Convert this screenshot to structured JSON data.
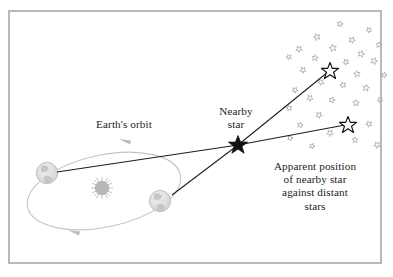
{
  "figure": {
    "kind": "stellar-parallax-diagram",
    "background_color": "#ffffff",
    "border_color": "#b9b9b9",
    "ink_color": "#242424",
    "faint_color": "#c9c9c9",
    "star_field_color": "#b0b0b4"
  },
  "labels": {
    "earth_orbit": "Earth's orbit",
    "nearby_star": "Nearby\nstar",
    "apparent_position": "Apparent position\nof nearby star\nagainst distant\nstars"
  },
  "objects": {
    "sun": {
      "name": "Sun",
      "x": 102,
      "y": 188,
      "radius": 8
    },
    "earth_left": {
      "name": "Earth position 1",
      "x": 47,
      "y": 173,
      "radius": 11
    },
    "earth_right": {
      "name": "Earth position 2",
      "x": 160,
      "y": 201,
      "radius": 11
    },
    "nearby_star": {
      "name": "Nearby star",
      "x": 238,
      "y": 145,
      "size": 9
    },
    "apparent_star_upper": {
      "name": "Apparent position A",
      "x": 330,
      "y": 70,
      "size": 8
    },
    "apparent_star_lower": {
      "name": "Apparent position B",
      "x": 348,
      "y": 124,
      "size": 8
    }
  },
  "orbit": {
    "center_x": 104,
    "center_y": 191,
    "radius_x": 78,
    "radius_y": 36,
    "rotation_deg": -12,
    "direction": "counterclockwise"
  },
  "sight_lines": [
    {
      "name": "earth1-to-star",
      "x1": 57,
      "y1": 172,
      "x2": 238,
      "y2": 145
    },
    {
      "name": "earth2-to-star",
      "x1": 172,
      "y1": 195,
      "x2": 238,
      "y2": 145
    },
    {
      "name": "star-to-apparent-upper",
      "x1": 238,
      "y1": 145,
      "x2": 328,
      "y2": 72
    },
    {
      "name": "star-to-apparent-lower",
      "x1": 238,
      "y1": 145,
      "x2": 345,
      "y2": 125
    }
  ],
  "distant_stars": [
    {
      "x": 340,
      "y": 24,
      "r": 3.2,
      "rot": 14
    },
    {
      "x": 369,
      "y": 30,
      "r": 3.0,
      "rot": 40
    },
    {
      "x": 317,
      "y": 37,
      "r": 3.6,
      "rot": -20
    },
    {
      "x": 352,
      "y": 40,
      "r": 3.4,
      "rot": 25
    },
    {
      "x": 379,
      "y": 45,
      "r": 3.1,
      "rot": 5
    },
    {
      "x": 299,
      "y": 49,
      "r": 3.3,
      "rot": 33
    },
    {
      "x": 333,
      "y": 48,
      "r": 3.8,
      "rot": -12
    },
    {
      "x": 361,
      "y": 54,
      "r": 3.5,
      "rot": 18
    },
    {
      "x": 289,
      "y": 57,
      "r": 2.9,
      "rot": 48
    },
    {
      "x": 315,
      "y": 58,
      "r": 3.4,
      "rot": 8
    },
    {
      "x": 346,
      "y": 62,
      "r": 3.2,
      "rot": -28
    },
    {
      "x": 374,
      "y": 61,
      "r": 3.6,
      "rot": 22
    },
    {
      "x": 303,
      "y": 70,
      "r": 3.3,
      "rot": 36
    },
    {
      "x": 357,
      "y": 74,
      "r": 3.5,
      "rot": -8
    },
    {
      "x": 384,
      "y": 75,
      "r": 3.0,
      "rot": 15
    },
    {
      "x": 321,
      "y": 82,
      "r": 3.4,
      "rot": 44
    },
    {
      "x": 343,
      "y": 85,
      "r": 3.2,
      "rot": -18
    },
    {
      "x": 366,
      "y": 88,
      "r": 3.6,
      "rot": 10
    },
    {
      "x": 295,
      "y": 90,
      "r": 3.1,
      "rot": 28
    },
    {
      "x": 310,
      "y": 98,
      "r": 3.4,
      "rot": -35
    },
    {
      "x": 332,
      "y": 100,
      "r": 3.3,
      "rot": 20
    },
    {
      "x": 356,
      "y": 103,
      "r": 3.5,
      "rot": 6
    },
    {
      "x": 380,
      "y": 100,
      "r": 3.0,
      "rot": 42
    },
    {
      "x": 289,
      "y": 108,
      "r": 3.2,
      "rot": -14
    },
    {
      "x": 319,
      "y": 115,
      "r": 3.4,
      "rot": 30
    },
    {
      "x": 300,
      "y": 125,
      "r": 3.1,
      "rot": 12
    },
    {
      "x": 369,
      "y": 124,
      "r": 3.3,
      "rot": -24
    },
    {
      "x": 330,
      "y": 133,
      "r": 3.5,
      "rot": 38
    },
    {
      "x": 355,
      "y": 140,
      "r": 3.2,
      "rot": 2
    },
    {
      "x": 312,
      "y": 146,
      "r": 3.0,
      "rot": 26
    },
    {
      "x": 377,
      "y": 145,
      "r": 3.4,
      "rot": -30
    },
    {
      "x": 290,
      "y": 138,
      "r": 2.9,
      "rot": 18
    }
  ]
}
